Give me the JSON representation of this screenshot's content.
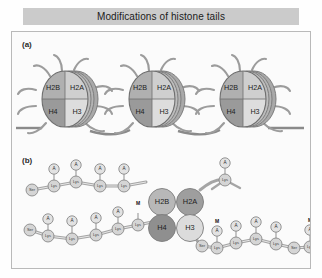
{
  "title": "Modifications of histone tails",
  "panels": [
    {
      "id": "a",
      "label": "(a)"
    },
    {
      "id": "b",
      "label": "(b)"
    }
  ],
  "histone_labels": {
    "h2b": "H2B",
    "h2a": "H2A",
    "h4": "H4",
    "h3": "H3"
  },
  "nucleosomes": [
    {
      "index": 1,
      "cx": 53,
      "cy": 67
    },
    {
      "index": 2,
      "cx": 140,
      "cy": 67
    },
    {
      "index": 3,
      "cx": 231,
      "cy": 67
    }
  ],
  "core_circles": [
    {
      "name": "H2B",
      "label": "H2B",
      "cx": 150,
      "cy": 170,
      "r": 13.5,
      "fill": "#b8b8b8"
    },
    {
      "name": "H2A",
      "label": "H2A",
      "cx": 178,
      "cy": 170,
      "r": 13.5,
      "fill": "#9e9e9e"
    },
    {
      "name": "H4",
      "label": "H4",
      "cx": 150,
      "cy": 196,
      "r": 13.5,
      "fill": "#8f8f8f"
    },
    {
      "name": "H3",
      "label": "H3",
      "cx": 178,
      "cy": 196,
      "r": 13.5,
      "fill": "#dcdcdc"
    }
  ],
  "tails": [
    {
      "name": "h2b-tail",
      "residues": [
        {
          "label": "Ser",
          "x": 22,
          "y": 189,
          "mod": null
        },
        {
          "label": "Lys",
          "x": 44,
          "y": 185,
          "mod": "A"
        },
        {
          "label": "Lys",
          "x": 66,
          "y": 181,
          "mod": "A"
        },
        {
          "label": "Lys",
          "x": 90,
          "y": 185,
          "mod": "A"
        },
        {
          "label": "Lys",
          "x": 114,
          "y": 185,
          "mod": "A"
        }
      ]
    },
    {
      "name": "h4-tail",
      "residues": [
        {
          "label": "Ser",
          "x": 20,
          "y": 229,
          "mod": null
        },
        {
          "label": "Lys",
          "x": 38,
          "y": 235,
          "mod": "A"
        },
        {
          "label": "Lys",
          "x": 62,
          "y": 238,
          "mod": "A"
        },
        {
          "label": "Lys",
          "x": 86,
          "y": 234,
          "mod": "A"
        },
        {
          "label": "Lys",
          "x": 108,
          "y": 228,
          "mod": "A"
        },
        {
          "label": "Lys",
          "x": 128,
          "y": 224,
          "mod": "M"
        }
      ]
    },
    {
      "name": "h2a-tail",
      "residues": [
        {
          "label": "Lys",
          "x": 215,
          "y": 179,
          "mod": "A"
        }
      ]
    },
    {
      "name": "h3-tail",
      "residues": [
        {
          "label": "Ser",
          "x": 192,
          "y": 243,
          "mod": null
        },
        {
          "label": "Lys",
          "x": 207,
          "y": 245,
          "mod": "M"
        },
        {
          "label": "Lys",
          "x": 226,
          "y": 240,
          "mod": "A"
        },
        {
          "label": "Lys",
          "x": 246,
          "y": 236,
          "mod": "A"
        },
        {
          "label": "Lys",
          "x": 266,
          "y": 241,
          "mod": "A"
        },
        {
          "label": "Ser",
          "x": 284,
          "y": 245,
          "mod": null
        },
        {
          "label": "Lys",
          "x": 300,
          "y": 244,
          "mod": "M"
        }
      ]
    }
  ],
  "modification_legend": {
    "acetyl": "A",
    "methyl": "M"
  },
  "colors": {
    "title_bar": "#cbcbcb",
    "panel_border": "#b9b9b9",
    "dna": "#8a8a8a",
    "tail_strand": "#9a9a9a",
    "residue_fill": "#d5d5d5",
    "mod_fill": "#e2e2e2"
  }
}
